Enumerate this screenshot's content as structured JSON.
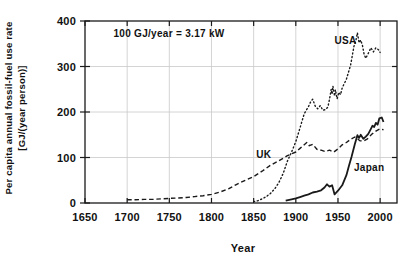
{
  "figure": {
    "background": "#ffffff",
    "ink_color": "#1a1a1a",
    "grid_color": "#c9c9c9"
  },
  "chart_data": {
    "type": "line",
    "title": "",
    "annotation": "100 GJ/year = 3.17 kW",
    "xlabel": "Year",
    "ylabel_line1": "Per capita annual fossil-fuel use rate",
    "ylabel_line2": "[GJ/(year person)]",
    "xlim": [
      1650,
      2020
    ],
    "ylim": [
      0,
      400
    ],
    "x_ticks": [
      1650,
      1700,
      1750,
      1800,
      1850,
      1900,
      1950,
      2000
    ],
    "y_ticks": [
      0,
      100,
      200,
      300,
      400
    ],
    "grid": true,
    "legend_position": "inline-labels",
    "series": [
      {
        "name": "USA",
        "label": "USA",
        "style": "dotted",
        "label_at": {
          "year": 1946,
          "value": 350
        },
        "points": [
          [
            1850,
            3
          ],
          [
            1855,
            5
          ],
          [
            1860,
            9
          ],
          [
            1865,
            14
          ],
          [
            1870,
            21
          ],
          [
            1875,
            31
          ],
          [
            1880,
            45
          ],
          [
            1885,
            65
          ],
          [
            1890,
            92
          ],
          [
            1895,
            112
          ],
          [
            1900,
            135
          ],
          [
            1905,
            165
          ],
          [
            1910,
            196
          ],
          [
            1915,
            212
          ],
          [
            1918,
            224
          ],
          [
            1920,
            228
          ],
          [
            1923,
            213
          ],
          [
            1926,
            207
          ],
          [
            1929,
            214
          ],
          [
            1932,
            204
          ],
          [
            1935,
            205
          ],
          [
            1938,
            211
          ],
          [
            1940,
            228
          ],
          [
            1942,
            250
          ],
          [
            1943,
            239
          ],
          [
            1944,
            257
          ],
          [
            1946,
            235
          ],
          [
            1947,
            249
          ],
          [
            1949,
            229
          ],
          [
            1951,
            243
          ],
          [
            1953,
            238
          ],
          [
            1955,
            253
          ],
          [
            1960,
            272
          ],
          [
            1965,
            303
          ],
          [
            1969,
            345
          ],
          [
            1971,
            355
          ],
          [
            1973,
            374
          ],
          [
            1975,
            352
          ],
          [
            1977,
            358
          ],
          [
            1979,
            347
          ],
          [
            1981,
            327
          ],
          [
            1983,
            318
          ],
          [
            1986,
            329
          ],
          [
            1989,
            341
          ],
          [
            1992,
            332
          ],
          [
            1995,
            341
          ],
          [
            1998,
            337
          ],
          [
            2000,
            331
          ]
        ]
      },
      {
        "name": "UK",
        "label": "UK",
        "style": "dashed",
        "label_at": {
          "year": 1853,
          "value": 98
        },
        "points": [
          [
            1700,
            7
          ],
          [
            1710,
            7
          ],
          [
            1720,
            8
          ],
          [
            1730,
            8
          ],
          [
            1740,
            9
          ],
          [
            1750,
            10
          ],
          [
            1760,
            11
          ],
          [
            1770,
            12
          ],
          [
            1780,
            14
          ],
          [
            1790,
            16
          ],
          [
            1800,
            19
          ],
          [
            1810,
            24
          ],
          [
            1820,
            31
          ],
          [
            1830,
            41
          ],
          [
            1840,
            50
          ],
          [
            1850,
            58
          ],
          [
            1860,
            70
          ],
          [
            1870,
            83
          ],
          [
            1880,
            93
          ],
          [
            1890,
            104
          ],
          [
            1900,
            112
          ],
          [
            1905,
            120
          ],
          [
            1910,
            128
          ],
          [
            1913,
            133
          ],
          [
            1916,
            126
          ],
          [
            1920,
            129
          ],
          [
            1925,
            118
          ],
          [
            1930,
            116
          ],
          [
            1935,
            113
          ],
          [
            1940,
            116
          ],
          [
            1945,
            112
          ],
          [
            1950,
            119
          ],
          [
            1955,
            128
          ],
          [
            1960,
            133
          ],
          [
            1965,
            140
          ],
          [
            1970,
            145
          ],
          [
            1973,
            141
          ],
          [
            1976,
            137
          ],
          [
            1980,
            136
          ],
          [
            1985,
            141
          ],
          [
            1990,
            151
          ],
          [
            1995,
            158
          ],
          [
            2000,
            163
          ],
          [
            2004,
            161
          ]
        ]
      },
      {
        "name": "Japan",
        "label": "Japan",
        "style": "solid",
        "label_at": {
          "year": 1969,
          "value": 71
        },
        "points": [
          [
            1888,
            5
          ],
          [
            1895,
            8
          ],
          [
            1900,
            10
          ],
          [
            1905,
            13
          ],
          [
            1910,
            16
          ],
          [
            1915,
            19
          ],
          [
            1920,
            23
          ],
          [
            1925,
            25
          ],
          [
            1930,
            28
          ],
          [
            1934,
            34
          ],
          [
            1937,
            41
          ],
          [
            1940,
            36
          ],
          [
            1943,
            39
          ],
          [
            1946,
            19
          ],
          [
            1950,
            27
          ],
          [
            1955,
            39
          ],
          [
            1960,
            61
          ],
          [
            1963,
            81
          ],
          [
            1966,
            101
          ],
          [
            1970,
            129
          ],
          [
            1973,
            149
          ],
          [
            1975,
            143
          ],
          [
            1977,
            150
          ],
          [
            1980,
            141
          ],
          [
            1983,
            146
          ],
          [
            1986,
            152
          ],
          [
            1989,
            163
          ],
          [
            1991,
            170
          ],
          [
            1993,
            167
          ],
          [
            1995,
            176
          ],
          [
            1997,
            172
          ],
          [
            1999,
            186
          ],
          [
            2002,
            188
          ],
          [
            2004,
            178
          ]
        ]
      }
    ]
  }
}
